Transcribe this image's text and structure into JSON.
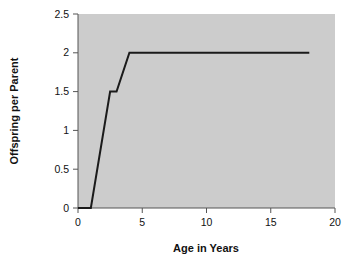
{
  "chart_data": {
    "type": "line",
    "title": "",
    "xlabel": "Age in Years",
    "ylabel": "Offspring per Parent",
    "xlim": [
      0,
      20
    ],
    "ylim": [
      0,
      2.5
    ],
    "xticks": [
      "0",
      "5",
      "10",
      "15",
      "20"
    ],
    "xtick_values": [
      0,
      5,
      10,
      15,
      20
    ],
    "yticks": [
      "0",
      "0.5",
      "1",
      "1.5",
      "2",
      "2.5"
    ],
    "ytick_values": [
      0,
      0.5,
      1,
      1.5,
      2,
      2.5
    ],
    "grid": false,
    "legend": false,
    "plot_background": "#cccccc",
    "figure_background": "#ffffff",
    "line_color": "#1a1a1a",
    "series": [
      {
        "name": "Offspring per Parent",
        "x": [
          0,
          1,
          2.5,
          3,
          4,
          18
        ],
        "y": [
          0,
          0,
          1.5,
          1.5,
          2,
          2
        ]
      }
    ]
  }
}
